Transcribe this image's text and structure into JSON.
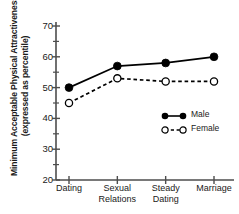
{
  "chart_data": {
    "type": "line",
    "title": "",
    "subtitle": "",
    "xlabel": "",
    "ylabel_line1": "Minimum Acceptable Physical Attractiveness",
    "ylabel_line2": "(expressed as percentile)",
    "categories": [
      "Dating",
      "Sexual Relations",
      "Steady Dating",
      "Marriage"
    ],
    "category_lines": [
      [
        "Dating"
      ],
      [
        "Sexual",
        "Relations"
      ],
      [
        "Steady",
        "Dating"
      ],
      [
        "Marriage"
      ]
    ],
    "series": [
      {
        "name": "Male",
        "values": [
          50,
          57,
          58,
          60
        ],
        "marker": "filled-circle",
        "linestyle": "solid",
        "color": "#000000"
      },
      {
        "name": "Female",
        "values": [
          45,
          53,
          52,
          52
        ],
        "marker": "open-circle",
        "linestyle": "dashed",
        "color": "#000000"
      }
    ],
    "ylim": [
      20,
      70
    ],
    "yticks": [
      20,
      30,
      40,
      50,
      60,
      70
    ],
    "ytick_labels": [
      "20",
      "30",
      "40",
      "50",
      "60",
      "70"
    ],
    "yminorticks": [
      25,
      35,
      45,
      55,
      65
    ],
    "grid": false,
    "legend_position": "lower-right-inside",
    "legend_entries": [
      "Male",
      "Female"
    ]
  }
}
